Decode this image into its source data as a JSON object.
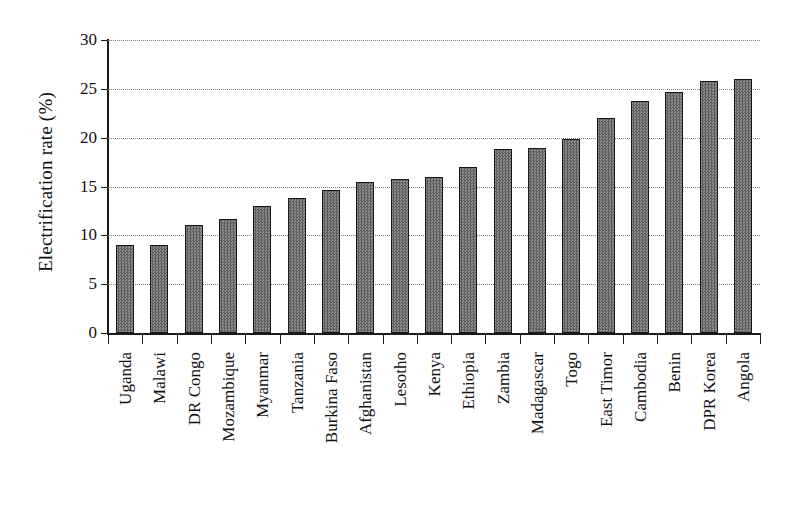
{
  "chart_data": {
    "type": "bar",
    "title": "",
    "xlabel": "",
    "ylabel": "Electrification rate (%)",
    "ylim": [
      0,
      30
    ],
    "yticks": [
      0,
      5,
      10,
      15,
      20,
      25,
      30
    ],
    "ytick_labels": [
      "0",
      "5",
      "10",
      "15",
      "20",
      "25",
      "30"
    ],
    "grid": "horizontal-dotted",
    "legend": "none",
    "bar_color": "#6f6f6f",
    "bar_edge_color": "#171717",
    "categories": [
      "Uganda",
      "Malawi",
      "DR Congo",
      "Mozambique",
      "Myanmar",
      "Tanzania",
      "Burkina Faso",
      "Afghanistan",
      "Lesotho",
      "Kenya",
      "Ethiopia",
      "Zambia",
      "Madagascar",
      "Togo",
      "East Timor",
      "Cambodia",
      "Benin",
      "DPR Korea",
      "Angola"
    ],
    "values": [
      9.0,
      9.0,
      11.1,
      11.7,
      13.0,
      13.8,
      14.6,
      15.5,
      15.8,
      16.0,
      17.0,
      18.8,
      18.9,
      19.9,
      22.0,
      23.8,
      24.7,
      25.8,
      26.0
    ]
  }
}
